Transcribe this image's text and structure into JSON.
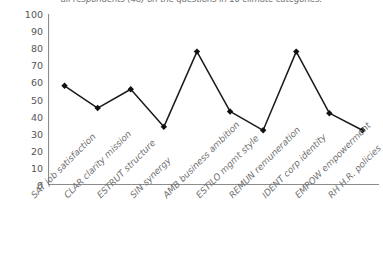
{
  "chart_data": {
    "type": "line",
    "title": "all respondents (48) on the questions in 10 climate categories.",
    "xlabel": "",
    "ylabel": "",
    "ylim": [
      0,
      100
    ],
    "ytick_step": 10,
    "yticks": [
      "100",
      "90",
      "80",
      "70",
      "60",
      "50",
      "40",
      "30",
      "20",
      "10",
      "0"
    ],
    "grid": false,
    "legend": "none",
    "marker": "diamond",
    "line_color": "#1a1a1a",
    "marker_color": "#111111",
    "axis_color": "#8c8c8c",
    "label_color": "#70706f",
    "categories": [
      "SAT job satisfaction",
      "CLAR clarity mission",
      "ESTRUT structure",
      "SIN synergy",
      "AMB business ambition",
      "ESTILO mgmt style",
      "REMUN remuneration",
      "IDENT corp identity",
      "EMPOW empowerment",
      "RH H.R. policies"
    ],
    "values": [
      58,
      45,
      56,
      34,
      78,
      43,
      32,
      78,
      42,
      32
    ]
  }
}
